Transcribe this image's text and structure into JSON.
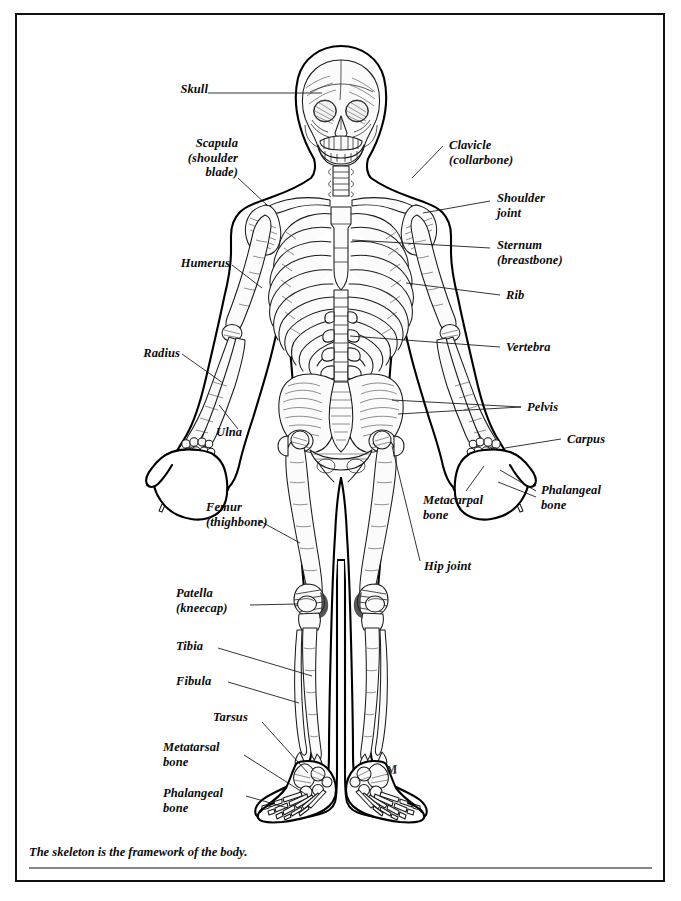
{
  "figure": {
    "caption": "The skeleton is the framework of the body.",
    "signature": "M",
    "border_color": "#111111",
    "background_color": "#ffffff",
    "ink_color": "#000000"
  },
  "labels": {
    "skull": "Skull",
    "scapula": "Scapula\n(shoulder\nblade)",
    "humerus": "Humerus",
    "radius": "Radius",
    "ulna": "Ulna",
    "femur": "Femur\n(thighbone)",
    "patella": "Patella\n(kneecap)",
    "tibia": "Tibia",
    "fibula": "Fibula",
    "tarsus": "Tarsus",
    "metatarsal": "Metatarsal\nbone",
    "phalangeal_foot": "Phalangeal\nbone",
    "clavicle": "Clavicle\n(collarbone)",
    "shoulder_joint": "Shoulder\njoint",
    "sternum": "Sternum\n(breastbone)",
    "rib": "Rib",
    "vertebra": "Vertebra",
    "pelvis": "Pelvis",
    "carpus": "Carpus",
    "phalangeal_hand": "Phalangeal\nbone",
    "metacarpal": "Metacarpal\nbone",
    "hip_joint": "Hip joint"
  },
  "label_list": [
    {
      "key": "skull",
      "text": "Skull",
      "side": "left",
      "x": 196,
      "y": 88
    },
    {
      "key": "scapula",
      "text": "Scapula (shoulder blade)",
      "side": "left",
      "x": 222,
      "y": 141
    },
    {
      "key": "humerus",
      "text": "Humerus",
      "side": "left",
      "x": 190,
      "y": 262
    },
    {
      "key": "radius",
      "text": "Radius",
      "side": "left",
      "x": 172,
      "y": 351
    },
    {
      "key": "ulna",
      "text": "Ulna",
      "side": "left",
      "x": 247,
      "y": 430
    },
    {
      "key": "femur",
      "text": "Femur (thighbone)",
      "side": "left",
      "x": 246,
      "y": 505
    },
    {
      "key": "patella",
      "text": "Patella (kneecap)",
      "side": "left",
      "x": 223,
      "y": 591
    },
    {
      "key": "tibia",
      "text": "Tibia",
      "side": "left",
      "x": 205,
      "y": 643
    },
    {
      "key": "fibula",
      "text": "Fibula",
      "side": "left",
      "x": 210,
      "y": 678
    },
    {
      "key": "tarsus",
      "text": "Tarsus",
      "side": "left",
      "x": 249,
      "y": 714
    },
    {
      "key": "metatarsal",
      "text": "Metatarsal bone",
      "side": "left",
      "x": 231,
      "y": 744
    },
    {
      "key": "phalangeal_foot",
      "text": "Phalangeal bone",
      "side": "left",
      "x": 232,
      "y": 790
    },
    {
      "key": "clavicle",
      "text": "Clavicle (collarbone)",
      "side": "right",
      "x": 449,
      "y": 142
    },
    {
      "key": "shoulder_joint",
      "text": "Shoulder joint",
      "side": "right",
      "x": 497,
      "y": 195
    },
    {
      "key": "sternum",
      "text": "Sternum (breastbone)",
      "side": "right",
      "x": 497,
      "y": 242
    },
    {
      "key": "rib",
      "text": "Rib",
      "side": "right",
      "x": 506,
      "y": 292
    },
    {
      "key": "vertebra",
      "text": "Vertebra",
      "side": "right",
      "x": 506,
      "y": 344
    },
    {
      "key": "pelvis",
      "text": "Pelvis",
      "side": "right",
      "x": 528,
      "y": 404
    },
    {
      "key": "carpus",
      "text": "Carpus",
      "side": "right",
      "x": 568,
      "y": 436
    },
    {
      "key": "phalangeal_hand",
      "text": "Phalangeal bone",
      "side": "right",
      "x": 541,
      "y": 487
    },
    {
      "key": "metacarpal",
      "text": "Metacarpal bone",
      "side": "right",
      "x": 423,
      "y": 497
    },
    {
      "key": "hip_joint",
      "text": "Hip joint",
      "side": "right",
      "x": 424,
      "y": 563
    }
  ]
}
